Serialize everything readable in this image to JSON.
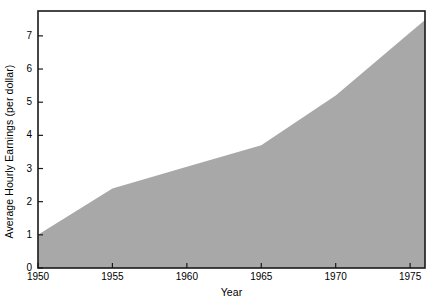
{
  "chart_data": {
    "type": "area",
    "title": "",
    "xlabel": "Year",
    "ylabel": "Average Hourly Earnings (per dollar)",
    "x": [
      1950,
      1955,
      1960,
      1965,
      1970,
      1975
    ],
    "values": [
      1.0,
      2.4,
      3.05,
      3.7,
      5.2,
      7.1
    ],
    "series": [
      {
        "name": "Average Hourly Earnings",
        "values": [
          1.0,
          2.4,
          3.05,
          3.7,
          5.2,
          7.1
        ]
      }
    ],
    "xlim": [
      1950,
      1976
    ],
    "ylim": [
      0,
      7.75
    ],
    "xticks": [
      1950,
      1955,
      1960,
      1965,
      1970,
      1975
    ],
    "yticks": [
      0,
      1,
      2,
      3,
      4,
      5,
      6,
      7
    ],
    "xtick_labels": [
      "1950",
      "1955",
      "1960",
      "1965",
      "1970",
      "1975"
    ],
    "ytick_labels": [
      "0",
      "1",
      "2",
      "3",
      "4",
      "5",
      "6",
      "7"
    ],
    "grid": false,
    "legend": false,
    "legend_position": "none",
    "fill_color": "#a8a8a8",
    "frame_color": "#1a1a1a",
    "background_color": "#ffffff"
  }
}
